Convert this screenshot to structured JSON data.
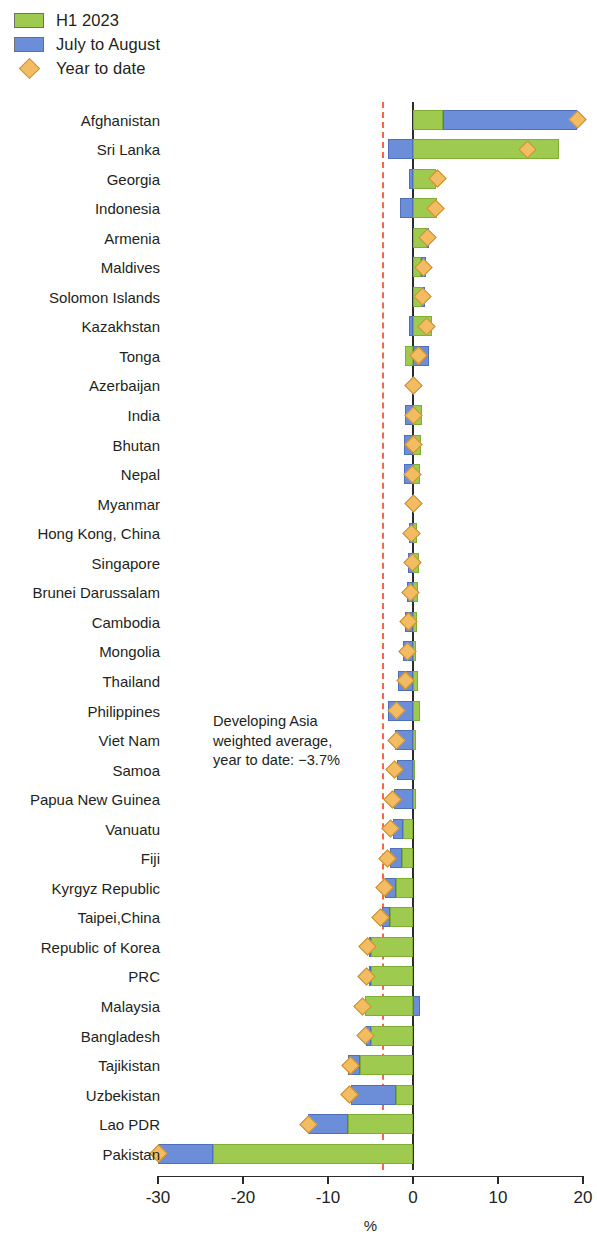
{
  "legend": {
    "items": [
      {
        "label": "H1 2023",
        "type": "swatch",
        "color": "#9ecb4f",
        "icon": "green-square-icon"
      },
      {
        "label": "July to August",
        "type": "swatch",
        "color": "#6c8ed8",
        "icon": "blue-square-icon"
      },
      {
        "label": "Year to date",
        "type": "diamond",
        "color": "#f3bc63",
        "icon": "orange-diamond-icon"
      }
    ]
  },
  "annotation": {
    "text": "Developing Asia\nweighted average,\nyear to date: −3.7%",
    "value": -3.7
  },
  "axis": {
    "title": "%",
    "ticks": [
      "-30",
      "-20",
      "-10",
      "0",
      "10",
      "20"
    ],
    "tick_values": [
      -30,
      -20,
      -10,
      0,
      10,
      20
    ]
  },
  "chart_data": {
    "type": "bar",
    "orientation": "horizontal",
    "title": "",
    "xlabel": "%",
    "ylabel": "",
    "xlim": [
      -31.5,
      20.5
    ],
    "grid": false,
    "legend_position": "top-left",
    "stacked": true,
    "reference_line": {
      "label": "Developing Asia weighted average, year to date",
      "value": -3.7,
      "color": "#f4674a",
      "style": "dashed"
    },
    "categories": [
      "Afghanistan",
      "Sri Lanka",
      "Georgia",
      "Indonesia",
      "Armenia",
      "Maldives",
      "Solomon Islands",
      "Kazakhstan",
      "Tonga",
      "Azerbaijan",
      "India",
      "Bhutan",
      "Nepal",
      "Myanmar",
      "Hong Kong, China",
      "Singapore",
      "Brunei Darussalam",
      "Cambodia",
      "Mongolia",
      "Thailand",
      "Philippines",
      "Viet Nam",
      "Samoa",
      "Papua New Guinea",
      "Vanuatu",
      "Fiji",
      "Kyrgyz Republic",
      "Taipei,China",
      "Republic of Korea",
      "PRC",
      "Malaysia",
      "Bangladesh",
      "Tajikistan",
      "Uzbekistan",
      "Lao PDR",
      "Pakistan"
    ],
    "series": [
      {
        "name": "H1 2023",
        "color": "#9ecb4f",
        "values": [
          3.5,
          17.2,
          2.7,
          2.8,
          1.6,
          0.9,
          1.0,
          2.2,
          -1.0,
          0.0,
          1.0,
          0.9,
          0.8,
          0.0,
          0.5,
          0.7,
          0.6,
          0.5,
          0.3,
          0.6,
          0.8,
          0.4,
          0.2,
          0.3,
          -1.2,
          -1.3,
          -2.0,
          -2.7,
          -4.9,
          -5.0,
          -5.6,
          -4.9,
          -6.2,
          -2.0,
          -7.6,
          -23.5
        ]
      },
      {
        "name": "July to August",
        "color": "#6c8ed8",
        "values": [
          15.8,
          -3.0,
          -0.5,
          -1.5,
          0.3,
          0.6,
          0.4,
          -0.5,
          1.9,
          0.0,
          -1.0,
          -1.1,
          -1.1,
          0.0,
          -0.5,
          -0.6,
          -0.7,
          -0.9,
          -1.2,
          -1.8,
          -2.9,
          -2.1,
          -1.9,
          -2.2,
          -1.1,
          -1.4,
          -1.3,
          -1.0,
          -0.3,
          -0.2,
          0.8,
          -0.6,
          -1.5,
          -5.3,
          -4.7,
          -6.5
        ]
      }
    ],
    "markers": {
      "name": "Year to date",
      "color": "#f3bc63",
      "values": [
        19.3,
        13.5,
        2.9,
        2.6,
        1.7,
        1.2,
        1.1,
        1.6,
        0.7,
        0.0,
        0.1,
        0.0,
        -0.1,
        0.0,
        -0.2,
        -0.1,
        -0.3,
        -0.5,
        -0.6,
        -0.9,
        -1.9,
        -2.0,
        -2.2,
        -2.4,
        -2.6,
        -3.0,
        -3.4,
        -3.8,
        -5.3,
        -5.5,
        -6.0,
        -5.6,
        -7.3,
        -7.5,
        -12.3,
        -30.0
      ]
    }
  }
}
